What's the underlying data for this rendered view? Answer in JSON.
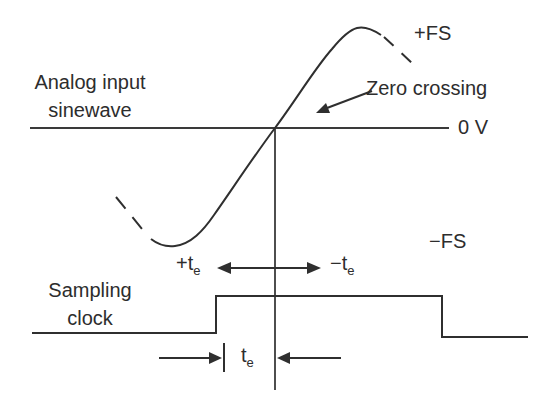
{
  "diagram": {
    "signals": {
      "analog_input": {
        "label_line1": "Analog input",
        "label_line2": "sinewave"
      },
      "sampling_clock": {
        "label_line1": "Sampling",
        "label_line2": "clock"
      }
    },
    "annotations": {
      "plus_fs": "+FS",
      "minus_fs": "−FS",
      "zero_v": "0 V",
      "zero_crossing": "Zero crossing",
      "plus_te": {
        "main": "+t",
        "sub": "e"
      },
      "minus_te": {
        "main": "−t",
        "sub": "e"
      },
      "te": {
        "main": "t",
        "sub": "e"
      }
    },
    "colors": {
      "ink": "#2f2f2f",
      "background": "#ffffff"
    }
  }
}
